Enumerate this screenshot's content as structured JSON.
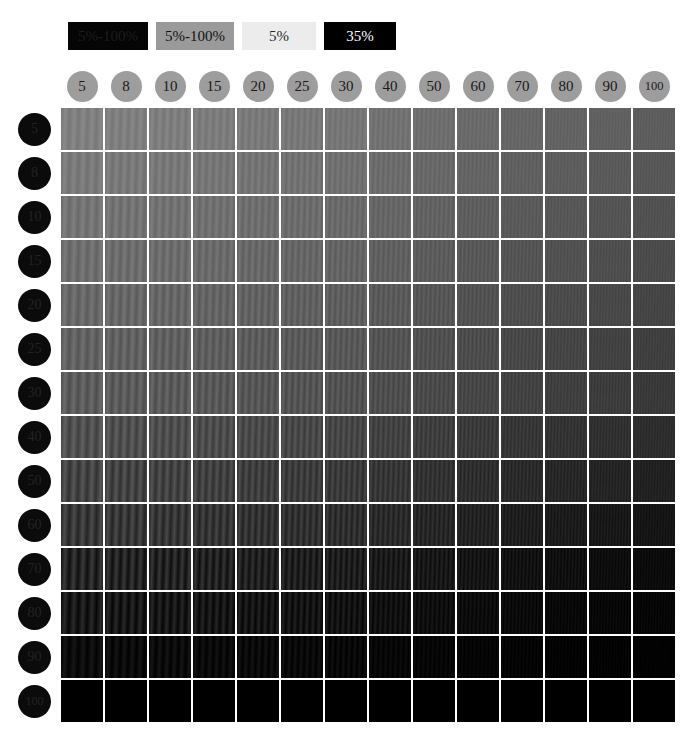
{
  "legend": {
    "items": [
      {
        "label": "5%-100%",
        "bg": "#050505",
        "fg": "#1d1d1d"
      },
      {
        "label": "5%-100%",
        "bg": "#9a9a9a",
        "fg": "#121212"
      },
      {
        "label": "5%",
        "bg": "#ececec",
        "fg": "#2a2a2a"
      },
      {
        "label": "35%",
        "bg": "#000000",
        "fg": "#ffffff"
      }
    ]
  },
  "columns": {
    "badge_bg": "#9d9d9d",
    "badge_fg": "#1a1a1a",
    "labels": [
      "5",
      "8",
      "10",
      "15",
      "20",
      "25",
      "30",
      "40",
      "50",
      "60",
      "70",
      "80",
      "90",
      "100"
    ]
  },
  "rows": {
    "badge_bg": "#0b0b0b",
    "badge_fg": "#232323",
    "labels": [
      "5",
      "8",
      "10",
      "15",
      "20",
      "25",
      "30",
      "40",
      "50",
      "60",
      "70",
      "80",
      "90",
      "100"
    ]
  },
  "chart_data": {
    "type": "heatmap",
    "title": "",
    "xlabel": "",
    "ylabel": "",
    "x": [
      "5",
      "8",
      "10",
      "15",
      "20",
      "25",
      "30",
      "40",
      "50",
      "60",
      "70",
      "80",
      "90",
      "100"
    ],
    "y": [
      "5",
      "8",
      "10",
      "15",
      "20",
      "25",
      "30",
      "40",
      "50",
      "60",
      "70",
      "80",
      "90",
      "100"
    ],
    "values": [
      [
        128,
        127,
        126,
        124,
        122,
        120,
        118,
        114,
        110,
        106,
        102,
        99,
        96,
        93
      ],
      [
        122,
        121,
        120,
        118,
        116,
        114,
        112,
        108,
        104,
        100,
        96,
        93,
        90,
        87
      ],
      [
        116,
        115,
        114,
        112,
        110,
        108,
        106,
        102,
        98,
        94,
        90,
        87,
        84,
        81
      ],
      [
        110,
        109,
        108,
        106,
        104,
        102,
        100,
        96,
        92,
        88,
        84,
        81,
        78,
        75
      ],
      [
        104,
        103,
        102,
        100,
        98,
        96,
        94,
        90,
        86,
        82,
        78,
        75,
        72,
        69
      ],
      [
        98,
        97,
        96,
        94,
        92,
        90,
        88,
        84,
        80,
        76,
        72,
        69,
        66,
        63
      ],
      [
        92,
        91,
        90,
        88,
        86,
        84,
        82,
        78,
        74,
        70,
        66,
        63,
        60,
        57
      ],
      [
        80,
        79,
        78,
        76,
        74,
        72,
        70,
        66,
        62,
        58,
        54,
        51,
        48,
        45
      ],
      [
        68,
        67,
        66,
        64,
        62,
        60,
        58,
        54,
        50,
        46,
        42,
        39,
        36,
        33
      ],
      [
        56,
        55,
        54,
        52,
        50,
        48,
        46,
        42,
        38,
        34,
        30,
        27,
        24,
        21
      ],
      [
        36,
        35,
        34,
        33,
        32,
        30,
        29,
        26,
        23,
        20,
        17,
        15,
        13,
        11
      ],
      [
        24,
        23,
        22,
        21,
        20,
        19,
        18,
        16,
        14,
        12,
        10,
        8,
        7,
        6
      ],
      [
        12,
        11,
        11,
        10,
        10,
        9,
        8,
        7,
        6,
        5,
        4,
        3,
        3,
        2
      ],
      [
        0,
        0,
        0,
        0,
        0,
        0,
        0,
        0,
        0,
        0,
        0,
        0,
        0,
        0
      ]
    ],
    "modulation_amplitude": [
      [
        9,
        9,
        9,
        8,
        8,
        8,
        7,
        7,
        6,
        6,
        5,
        5,
        4,
        4
      ],
      [
        10,
        10,
        10,
        9,
        9,
        9,
        8,
        8,
        7,
        6,
        6,
        5,
        5,
        4
      ],
      [
        11,
        11,
        11,
        10,
        10,
        10,
        9,
        8,
        8,
        7,
        6,
        6,
        5,
        5
      ],
      [
        12,
        12,
        12,
        11,
        11,
        10,
        10,
        9,
        8,
        8,
        7,
        6,
        6,
        5
      ],
      [
        13,
        13,
        13,
        12,
        12,
        11,
        11,
        10,
        9,
        8,
        7,
        7,
        6,
        5
      ],
      [
        14,
        14,
        14,
        13,
        13,
        12,
        11,
        10,
        9,
        9,
        8,
        7,
        6,
        6
      ],
      [
        15,
        15,
        15,
        14,
        13,
        13,
        12,
        11,
        10,
        9,
        8,
        7,
        7,
        6
      ],
      [
        17,
        17,
        16,
        16,
        15,
        14,
        13,
        12,
        11,
        10,
        9,
        8,
        7,
        6
      ],
      [
        19,
        19,
        18,
        17,
        16,
        15,
        14,
        13,
        11,
        10,
        9,
        8,
        7,
        6
      ],
      [
        20,
        20,
        19,
        18,
        17,
        16,
        15,
        13,
        12,
        10,
        9,
        8,
        7,
        6
      ],
      [
        22,
        21,
        21,
        20,
        18,
        17,
        16,
        14,
        12,
        10,
        9,
        8,
        6,
        5
      ],
      [
        18,
        18,
        17,
        16,
        15,
        14,
        13,
        11,
        9,
        8,
        7,
        6,
        5,
        4
      ],
      [
        10,
        10,
        10,
        9,
        9,
        8,
        8,
        6,
        5,
        4,
        4,
        3,
        3,
        2
      ],
      [
        0,
        0,
        0,
        0,
        0,
        0,
        0,
        0,
        0,
        0,
        0,
        0,
        0,
        0
      ]
    ],
    "grating_period_px": [
      9,
      8,
      7.5,
      7,
      6.5,
      6,
      5.5,
      5,
      4.5,
      4,
      3.6,
      3.3,
      3,
      2.8
    ]
  }
}
